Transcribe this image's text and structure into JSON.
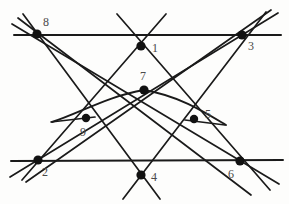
{
  "figure": {
    "width": 289,
    "height": 204,
    "background_color": "#fdfdfc",
    "line_color": "#1a1a1a",
    "node_color": "#111111",
    "label_color": "#4a4a4a"
  },
  "points": [
    {
      "id": "1",
      "label": "1",
      "x": 141,
      "y": 46,
      "r": 4.6,
      "label_x": 152,
      "label_y": 42
    },
    {
      "id": "2",
      "label": "2",
      "x": 38,
      "y": 160,
      "r": 4.6,
      "label_x": 42,
      "label_y": 166
    },
    {
      "id": "3",
      "label": "3",
      "x": 242,
      "y": 35,
      "r": 4.6,
      "label_x": 248,
      "label_y": 40
    },
    {
      "id": "4",
      "label": "4",
      "x": 141,
      "y": 175,
      "r": 4.6,
      "label_x": 151,
      "label_y": 171
    },
    {
      "id": "5",
      "label": "5",
      "x": 194,
      "y": 119,
      "r": 4.2,
      "label_x": 205,
      "label_y": 108
    },
    {
      "id": "6",
      "label": "6",
      "x": 240,
      "y": 161,
      "r": 4.6,
      "label_x": 228,
      "label_y": 168
    },
    {
      "id": "7",
      "label": "7",
      "x": 144,
      "y": 90,
      "r": 4.6,
      "label_x": 140,
      "label_y": 70
    },
    {
      "id": "8",
      "label": "8",
      "x": 37,
      "y": 34,
      "r": 4.6,
      "label_x": 43,
      "label_y": 16
    },
    {
      "id": "9",
      "label": "9",
      "x": 86,
      "y": 118,
      "r": 4.2,
      "label_x": 80,
      "label_y": 126
    }
  ],
  "lines": [
    {
      "name": "line-top-horizontal",
      "through": [
        "8",
        "3"
      ],
      "x1": 14,
      "y1": 35,
      "x2": 281,
      "y2": 35,
      "width": 2.0
    },
    {
      "name": "line-bottom-horizontal",
      "through": [
        "2",
        "6"
      ],
      "x1": 11,
      "y1": 161,
      "x2": 283,
      "y2": 160,
      "width": 2.0
    },
    {
      "name": "line-8-to-6",
      "through": [
        "8",
        "9",
        "6"
      ],
      "x1": 12,
      "y1": 24,
      "x2": 279,
      "y2": 184,
      "width": 1.7
    },
    {
      "name": "line-8-to-4",
      "through": [
        "8",
        "4"
      ],
      "x1": 23,
      "y1": 14,
      "x2": 160,
      "y2": 199,
      "width": 1.7
    },
    {
      "name": "line-8-to-5-6",
      "through": [
        "8",
        "5"
      ],
      "x1": 18,
      "y1": 18,
      "x2": 251,
      "y2": 195,
      "width": 1.7
    },
    {
      "name": "line-3-to-2",
      "through": [
        "3",
        "9",
        "2"
      ],
      "x1": 278,
      "y1": 13,
      "x2": 10,
      "y2": 177,
      "width": 1.7
    },
    {
      "name": "line-3-to-4",
      "through": [
        "3",
        "4"
      ],
      "x1": 266,
      "y1": 12,
      "x2": 123,
      "y2": 199,
      "width": 1.7
    },
    {
      "name": "line-3-to-2-lower",
      "through": [
        "3",
        "2"
      ],
      "x1": 271,
      "y1": 10,
      "x2": 26,
      "y2": 182,
      "width": 1.7
    },
    {
      "name": "line-1-to-2",
      "through": [
        "1",
        "9",
        "2"
      ],
      "x1": 166,
      "y1": 14,
      "x2": 22,
      "y2": 180,
      "width": 1.7
    },
    {
      "name": "line-1-to-6",
      "through": [
        "1",
        "5",
        "6"
      ],
      "x1": 117,
      "y1": 14,
      "x2": 270,
      "y2": 190,
      "width": 1.7
    },
    {
      "name": "segment-9-left-stub",
      "through": [
        "9"
      ],
      "x1": 51,
      "y1": 122,
      "x2": 95,
      "y2": 117,
      "width": 1.7
    },
    {
      "name": "segment-5-right-stub",
      "through": [
        "5"
      ],
      "x1": 185,
      "y1": 120,
      "x2": 225,
      "y2": 125,
      "width": 1.7
    }
  ],
  "conic": {
    "name": "conic-arc-9-7-5",
    "through": [
      "9",
      "7",
      "5"
    ],
    "path": "M 52 122 C 80 113 108 96 144 90 C 180 96 206 113 226 125",
    "width": 1.9
  }
}
